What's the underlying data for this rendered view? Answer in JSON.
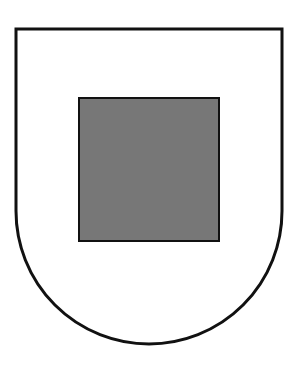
{
  "diagram": {
    "shape": "heraldic-shield",
    "background_color": "#ffffff",
    "shield": {
      "fill": "#ffffff",
      "stroke": "#111111",
      "stroke_width": 3,
      "left": 16,
      "right": 282,
      "top": 29,
      "straight_bottom": 211,
      "arc_bottom": 344
    },
    "inner_square": {
      "fill": "#777777",
      "stroke": "#111111",
      "stroke_width": 2,
      "x": 79,
      "y": 98,
      "width": 140,
      "height": 143
    }
  }
}
